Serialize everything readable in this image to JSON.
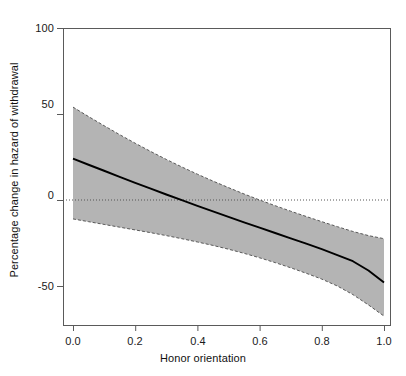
{
  "chart_data": {
    "type": "line",
    "title": "",
    "subtitle": "",
    "xlabel": "Honor orientation",
    "ylabel": "Percentage change in hazard of withdrawal",
    "xlim": [
      0.0,
      1.0
    ],
    "ylim": [
      -75,
      112
    ],
    "xticks": [
      0.0,
      0.2,
      0.4,
      0.6,
      0.8,
      1.0
    ],
    "xtick_labels": [
      "0.0",
      "0.2",
      "0.4",
      "0.6",
      "0.8",
      "1.0"
    ],
    "yticks": [
      100,
      50,
      0,
      -50
    ],
    "ytick_labels": [
      "100",
      "50",
      "0",
      "-50"
    ],
    "grid": false,
    "legend": "none",
    "reference_line": {
      "orientation": "horizontal",
      "value": 0,
      "style": "dotted",
      "color": "#555555"
    },
    "series": [
      {
        "name": "Fitted percentage change in hazard",
        "type": "line",
        "color": "#000000",
        "style": "solid",
        "x": [
          0.0,
          0.05,
          0.1,
          0.15,
          0.2,
          0.25,
          0.3,
          0.35,
          0.4,
          0.45,
          0.5,
          0.55,
          0.6,
          0.65,
          0.7,
          0.75,
          0.8,
          0.85,
          0.9,
          0.95,
          1.0
        ],
        "values": [
          24.0,
          20.5,
          17.0,
          13.5,
          10.0,
          6.6,
          3.2,
          -0.1,
          -3.4,
          -6.6,
          -9.8,
          -13.0,
          -16.1,
          -19.2,
          -22.3,
          -25.4,
          -28.6,
          -32.0,
          -35.6,
          -41.0,
          -48.0
        ]
      },
      {
        "name": "95% confidence band upper limit",
        "type": "line",
        "color": "#595959",
        "style": "dashed",
        "x": [
          0.0,
          0.05,
          0.1,
          0.15,
          0.2,
          0.25,
          0.3,
          0.35,
          0.4,
          0.45,
          0.5,
          0.55,
          0.6,
          0.65,
          0.7,
          0.75,
          0.8,
          0.85,
          0.9,
          0.95,
          1.0
        ],
        "values": [
          54.0,
          48.5,
          43.2,
          38.0,
          33.0,
          28.2,
          23.6,
          19.2,
          15.0,
          11.0,
          7.2,
          3.5,
          0.0,
          -3.3,
          -6.5,
          -9.6,
          -12.6,
          -15.5,
          -18.3,
          -20.7,
          -22.5
        ]
      },
      {
        "name": "95% confidence band lower limit",
        "type": "line",
        "color": "#595959",
        "style": "dashed",
        "x": [
          0.0,
          0.05,
          0.1,
          0.15,
          0.2,
          0.25,
          0.3,
          0.35,
          0.4,
          0.45,
          0.5,
          0.55,
          0.6,
          0.65,
          0.7,
          0.75,
          0.8,
          0.85,
          0.9,
          0.95,
          1.0
        ],
        "values": [
          -11.0,
          -12.6,
          -14.2,
          -15.8,
          -17.4,
          -19.0,
          -20.7,
          -22.5,
          -24.4,
          -26.4,
          -28.6,
          -31.0,
          -33.6,
          -36.4,
          -39.4,
          -42.6,
          -46.0,
          -50.0,
          -55.0,
          -61.0,
          -67.5
        ]
      }
    ],
    "band": {
      "name": "95% confidence band",
      "fill_color": "#b4b4b4",
      "border_style": "dashed",
      "border_color": "#595959"
    },
    "annotations": [],
    "axis_color": "#5a5a5a"
  }
}
